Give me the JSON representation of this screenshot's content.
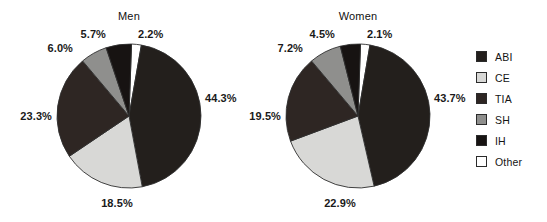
{
  "figure": {
    "background": "#ffffff",
    "width": 547,
    "height": 222
  },
  "legend": {
    "position": "right",
    "items": [
      {
        "label": "ABI",
        "color": "#231f1c"
      },
      {
        "label": "CE",
        "color": "#d8d8d6"
      },
      {
        "label": "TIA",
        "color": "#2e2623"
      },
      {
        "label": "SH",
        "color": "#8f8f8d"
      },
      {
        "label": "IH",
        "color": "#171312"
      },
      {
        "label": "Other",
        "color": "#ffffff"
      }
    ]
  },
  "charts": [
    {
      "title": "Men",
      "title_x": 129,
      "title_y": 10,
      "cx": 129,
      "cy": 116,
      "r": 72,
      "start_angle": -88,
      "slices": [
        {
          "category": "Other",
          "value": 2.2,
          "color": "#ffffff",
          "label": "2.2%",
          "lx": 138,
          "ly": 28,
          "anchor": "start"
        },
        {
          "category": "ABI",
          "value": 44.3,
          "color": "#231f1c",
          "label": "44.3%",
          "lx": 205,
          "ly": 92,
          "anchor": "start"
        },
        {
          "category": "CE",
          "value": 18.5,
          "color": "#d8d8d6",
          "label": "18.5%",
          "lx": 117,
          "ly": 197,
          "anchor": "mid"
        },
        {
          "category": "TIA",
          "value": 23.3,
          "color": "#2e2623",
          "label": "23.3%",
          "lx": 52,
          "ly": 110,
          "anchor": "end"
        },
        {
          "category": "SH",
          "value": 6.0,
          "color": "#8f8f8d",
          "label": "6.0%",
          "lx": 73,
          "ly": 42,
          "anchor": "end"
        },
        {
          "category": "IH",
          "value": 5.7,
          "color": "#171312",
          "label": "5.7%",
          "lx": 106,
          "ly": 28,
          "anchor": "end"
        }
      ]
    },
    {
      "title": "Women",
      "title_x": 358,
      "title_y": 10,
      "cx": 358,
      "cy": 116,
      "r": 72,
      "start_angle": -88,
      "slices": [
        {
          "category": "Other",
          "value": 2.1,
          "color": "#ffffff",
          "label": "2.1%",
          "lx": 367,
          "ly": 28,
          "anchor": "start"
        },
        {
          "category": "ABI",
          "value": 43.7,
          "color": "#231f1c",
          "label": "43.7%",
          "lx": 434,
          "ly": 92,
          "anchor": "start"
        },
        {
          "category": "CE",
          "value": 22.9,
          "color": "#d8d8d6",
          "label": "22.9%",
          "lx": 340,
          "ly": 197,
          "anchor": "mid"
        },
        {
          "category": "TIA",
          "value": 19.5,
          "color": "#2e2623",
          "label": "19.5%",
          "lx": 281,
          "ly": 110,
          "anchor": "end"
        },
        {
          "category": "SH",
          "value": 7.2,
          "color": "#8f8f8d",
          "label": "7.2%",
          "lx": 303,
          "ly": 42,
          "anchor": "end"
        },
        {
          "category": "IH",
          "value": 4.5,
          "color": "#171312",
          "label": "4.5%",
          "lx": 335,
          "ly": 28,
          "anchor": "end"
        }
      ]
    }
  ],
  "chart_data": {
    "type": "pie",
    "title": "",
    "categories": [
      "ABI",
      "CE",
      "TIA",
      "SH",
      "IH",
      "Other"
    ],
    "units": "percent",
    "legend_position": "right",
    "charts": [
      {
        "title": "Men",
        "labels": [
          "ABI",
          "CE",
          "TIA",
          "SH",
          "IH",
          "Other"
        ],
        "values": [
          44.3,
          18.5,
          23.3,
          6.0,
          5.7,
          2.2
        ],
        "value_labels": [
          "44.3%",
          "18.5%",
          "23.3%",
          "6.0%",
          "5.7%",
          "2.2%"
        ]
      },
      {
        "title": "Women",
        "labels": [
          "ABI",
          "CE",
          "TIA",
          "SH",
          "IH",
          "Other"
        ],
        "values": [
          43.7,
          22.9,
          19.5,
          7.2,
          4.5,
          2.1
        ],
        "value_labels": [
          "43.7%",
          "22.9%",
          "19.5%",
          "7.2%",
          "4.5%",
          "2.1%"
        ]
      }
    ],
    "colors": {
      "ABI": "#231f1c",
      "CE": "#d8d8d6",
      "TIA": "#2e2623",
      "SH": "#8f8f8d",
      "IH": "#171312",
      "Other": "#ffffff"
    },
    "grid": false,
    "xlabel": "",
    "ylabel": ""
  }
}
